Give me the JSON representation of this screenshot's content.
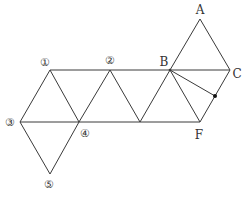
{
  "figure": {
    "title": "",
    "colors": {
      "line": "#3a3a3a",
      "text": "#333333",
      "background": "#ffffff"
    },
    "vertices": {
      "A": {
        "label": "A",
        "x": 200,
        "y": 19
      },
      "B": {
        "label": "B",
        "x": 170,
        "y": 70
      },
      "C": {
        "label": "C",
        "x": 230,
        "y": 70
      },
      "F": {
        "label": "F",
        "x": 200,
        "y": 122
      },
      "v1": {
        "label": "①",
        "x": 50,
        "y": 70
      },
      "v2": {
        "label": "②",
        "x": 110,
        "y": 70
      },
      "v3": {
        "label": "③",
        "x": 20,
        "y": 122
      },
      "v4": {
        "label": "④",
        "x": 79,
        "y": 122
      },
      "v5": {
        "label": "⑤",
        "x": 50,
        "y": 174
      },
      "M": {
        "label": "",
        "x": 140,
        "y": 122
      },
      "P": {
        "label": "",
        "x": 215,
        "y": 96,
        "marker": "dot"
      }
    },
    "labels": {
      "A": "A",
      "B": "B",
      "C": "C",
      "F": "F",
      "v1": "①",
      "v2": "②",
      "v3": "③",
      "v4": "④",
      "v5": "⑤"
    },
    "segments": [
      [
        "v1",
        "C"
      ],
      [
        "v3",
        "F"
      ],
      [
        "v3",
        "v1"
      ],
      [
        "v1",
        "v4"
      ],
      [
        "v4",
        "v2"
      ],
      [
        "v2",
        "M"
      ],
      [
        "M",
        "B"
      ],
      [
        "B",
        "F"
      ],
      [
        "F",
        "C"
      ],
      [
        "B",
        "A"
      ],
      [
        "A",
        "C"
      ],
      [
        "v3",
        "v5"
      ],
      [
        "v5",
        "v4"
      ],
      [
        "B",
        "P"
      ]
    ],
    "point_marker": {
      "name": "point-on-CF",
      "on_segment": [
        "C",
        "F"
      ]
    }
  }
}
